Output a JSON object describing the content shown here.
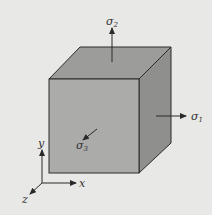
{
  "diagram": {
    "title": "",
    "stresses": [
      {
        "symbol": "σ",
        "subscript": "1",
        "direction": "x (right)"
      },
      {
        "symbol": "σ",
        "subscript": "2",
        "direction": "y (up)"
      },
      {
        "symbol": "σ",
        "subscript": "3",
        "direction": "z (toward viewer)"
      }
    ],
    "axes": [
      {
        "label": "x"
      },
      {
        "label": "y"
      },
      {
        "label": "z"
      }
    ],
    "colors": {
      "background": "#e8e8e6",
      "front_face": "#a9a9a7",
      "top_face": "#9a9a98",
      "right_face": "#8e8e8c",
      "line": "#2a2a2a"
    }
  }
}
